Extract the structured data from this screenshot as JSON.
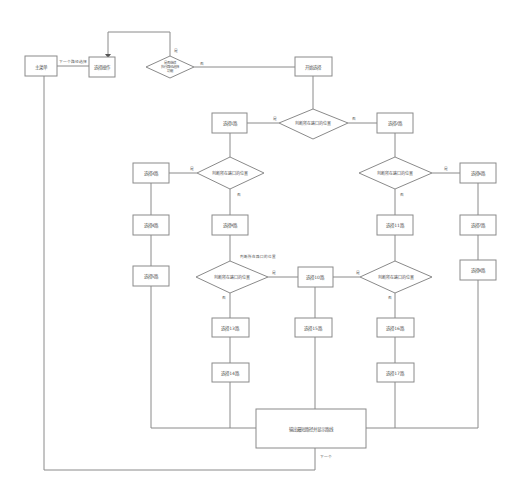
{
  "diagram": {
    "type": "flowchart",
    "colors": {
      "line": "#8a8a8a",
      "text": "#555555",
      "background": "#ffffff"
    },
    "nodes": {
      "start": "主菜单",
      "select_op": "选择操作",
      "decision_top": "是否继续\n执行路径选择\n功能",
      "begin": "开始选择",
      "decision_main": "判断所在路口的位置",
      "box_main_left": "选择1路",
      "box_main_right": "选择2路",
      "decision_left": "判断所在路口的位置",
      "decision_right": "判断所在路口的位置",
      "box_far_left_1": "选择3路",
      "box_far_left_2": "选择4路",
      "box_far_left_3": "选择5路",
      "box_far_right_1": "选择6路",
      "box_far_right_2": "选择7路",
      "box_far_right_3": "选择8路",
      "box_left_mid": "选择9路",
      "decision_left_low": "判断所在路口的位置",
      "decision_left_low_caption": "判断所在路口的位置",
      "box_center": "选择10路",
      "decision_right_low": "判断所在路口的位置",
      "box_right_mid_1": "选择11路",
      "box_right_mid_2": "选择12路",
      "box_left_low_1": "选择13路",
      "box_left_low_2": "选择14路",
      "box_center_low": "选择15路",
      "box_right_low_1": "选择16路",
      "box_right_low_2": "选择17路",
      "end": "输出最短路径并显示路线"
    },
    "edge_labels": {
      "start_to_select": "下一个路径选择",
      "yes": "是",
      "no": "否",
      "next": "下一个"
    }
  }
}
